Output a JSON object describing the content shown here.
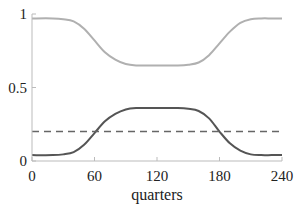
{
  "chart_data": {
    "type": "line",
    "title": "",
    "xlabel": "quarters",
    "ylabel": "",
    "xlim": [
      0,
      240
    ],
    "ylim": [
      0,
      1
    ],
    "x_ticks": [
      0,
      60,
      120,
      180,
      240
    ],
    "x_tick_labels": [
      "0",
      "60",
      "120",
      "180",
      "240"
    ],
    "y_ticks": [
      0,
      0.5,
      1
    ],
    "y_tick_labels": [
      "0",
      "0.5",
      "1"
    ],
    "grid": false,
    "legend": null,
    "x": [
      0,
      20,
      30,
      40,
      50,
      60,
      70,
      80,
      90,
      100,
      110,
      120,
      130,
      140,
      150,
      160,
      170,
      180,
      190,
      200,
      210,
      220,
      230,
      240
    ],
    "series": [
      {
        "name": "light-gray-series",
        "color": "#b0b0b0",
        "style": "solid",
        "values": [
          0.97,
          0.97,
          0.965,
          0.95,
          0.9,
          0.82,
          0.74,
          0.69,
          0.66,
          0.65,
          0.65,
          0.65,
          0.65,
          0.65,
          0.655,
          0.67,
          0.72,
          0.8,
          0.88,
          0.94,
          0.965,
          0.97,
          0.97,
          0.97
        ]
      },
      {
        "name": "dark-gray-series",
        "color": "#555555",
        "style": "solid",
        "values": [
          0.04,
          0.04,
          0.045,
          0.06,
          0.11,
          0.19,
          0.27,
          0.32,
          0.35,
          0.36,
          0.36,
          0.36,
          0.36,
          0.36,
          0.355,
          0.34,
          0.29,
          0.2,
          0.12,
          0.07,
          0.045,
          0.04,
          0.04,
          0.04
        ]
      },
      {
        "name": "dashed-reference",
        "color": "#666666",
        "style": "dashed",
        "values": [
          0.2,
          0.2,
          0.2,
          0.2,
          0.2,
          0.2,
          0.2,
          0.2,
          0.2,
          0.2,
          0.2,
          0.2,
          0.2,
          0.2,
          0.2,
          0.2,
          0.2,
          0.2,
          0.2,
          0.2,
          0.2,
          0.2,
          0.2,
          0.2
        ]
      }
    ]
  }
}
